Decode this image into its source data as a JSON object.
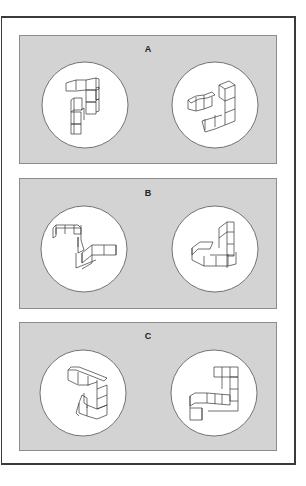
{
  "figure": {
    "colors": {
      "panel_fill": "#d3d3d3",
      "panel_border": "#8c8c8c",
      "circle_fill": "#ffffff",
      "frame_border": "#3a3a3a",
      "line": "#333333"
    },
    "panels": [
      {
        "label": "A",
        "left_figure": "cube-structure",
        "right_figure": "cube-structure-rotated"
      },
      {
        "label": "B",
        "left_figure": "cube-structure",
        "right_figure": "cube-structure-rotated"
      },
      {
        "label": "C",
        "left_figure": "cube-structure",
        "right_figure": "cube-structure-rotated"
      }
    ]
  }
}
